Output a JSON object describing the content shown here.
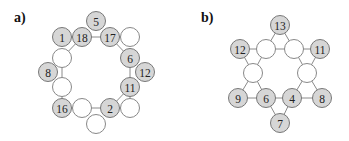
{
  "panels": [
    {
      "label": "a)",
      "label_pos": [
        14,
        10
      ],
      "nodes": [
        {
          "id": "n5",
          "text": "5",
          "x": 96,
          "y": 21,
          "filled": true
        },
        {
          "id": "n1",
          "text": "1",
          "x": 62,
          "y": 37,
          "filled": true
        },
        {
          "id": "n18",
          "text": "18",
          "x": 82,
          "y": 37,
          "filled": true
        },
        {
          "id": "n17",
          "text": "17",
          "x": 110,
          "y": 37,
          "filled": true
        },
        {
          "id": "eTR",
          "text": "",
          "x": 130,
          "y": 37,
          "filled": false
        },
        {
          "id": "eL1",
          "text": "",
          "x": 62,
          "y": 58,
          "filled": false
        },
        {
          "id": "n6",
          "text": "6",
          "x": 130,
          "y": 58,
          "filled": true
        },
        {
          "id": "n8",
          "text": "8",
          "x": 48,
          "y": 72,
          "filled": true
        },
        {
          "id": "n12",
          "text": "12",
          "x": 145,
          "y": 72,
          "filled": true
        },
        {
          "id": "eL2",
          "text": "",
          "x": 62,
          "y": 87,
          "filled": false
        },
        {
          "id": "n11",
          "text": "11",
          "x": 130,
          "y": 87,
          "filled": true
        },
        {
          "id": "n16",
          "text": "16",
          "x": 62,
          "y": 108,
          "filled": true
        },
        {
          "id": "eB1",
          "text": "",
          "x": 82,
          "y": 108,
          "filled": false
        },
        {
          "id": "n2",
          "text": "2",
          "x": 110,
          "y": 108,
          "filled": true
        },
        {
          "id": "eBR",
          "text": "",
          "x": 130,
          "y": 108,
          "filled": false
        },
        {
          "id": "eB",
          "text": "",
          "x": 96,
          "y": 124,
          "filled": false
        }
      ],
      "edges": [
        [
          "n1",
          "n18"
        ],
        [
          "n18",
          "n17"
        ],
        [
          "n17",
          "eTR"
        ],
        [
          "n17",
          "n6"
        ],
        [
          "n18",
          "eL1"
        ],
        [
          "eL1",
          "eL2"
        ],
        [
          "eL2",
          "n16"
        ],
        [
          "n16",
          "eB1"
        ],
        [
          "eB1",
          "n2"
        ],
        [
          "n2",
          "eBR"
        ],
        [
          "n2",
          "n11"
        ],
        [
          "n11",
          "eBR"
        ],
        [
          "n6",
          "n11"
        ]
      ]
    },
    {
      "label": "b)",
      "label_pos": [
        201,
        10
      ],
      "nodes": [
        {
          "id": "n13",
          "text": "13",
          "x": 280,
          "y": 25,
          "filled": true
        },
        {
          "id": "n12",
          "text": "12",
          "x": 240,
          "y": 49,
          "filled": true
        },
        {
          "id": "eTL",
          "text": "",
          "x": 266,
          "y": 49,
          "filled": false
        },
        {
          "id": "eTR",
          "text": "",
          "x": 294,
          "y": 49,
          "filled": false
        },
        {
          "id": "n11",
          "text": "11",
          "x": 320,
          "y": 49,
          "filled": true
        },
        {
          "id": "eL",
          "text": "",
          "x": 253,
          "y": 73,
          "filled": false
        },
        {
          "id": "eR",
          "text": "",
          "x": 307,
          "y": 73,
          "filled": false
        },
        {
          "id": "n9",
          "text": "9",
          "x": 238,
          "y": 98,
          "filled": true
        },
        {
          "id": "n6",
          "text": "6",
          "x": 266,
          "y": 98,
          "filled": true
        },
        {
          "id": "n4",
          "text": "4",
          "x": 292,
          "y": 98,
          "filled": true
        },
        {
          "id": "n8",
          "text": "8",
          "x": 322,
          "y": 98,
          "filled": true
        },
        {
          "id": "n7",
          "text": "7",
          "x": 280,
          "y": 123,
          "filled": true
        }
      ],
      "edges": [
        [
          "n13",
          "eTL"
        ],
        [
          "n13",
          "eTR"
        ],
        [
          "n12",
          "eTL"
        ],
        [
          "eTL",
          "eTR"
        ],
        [
          "eTR",
          "n11"
        ],
        [
          "n12",
          "eL"
        ],
        [
          "eTL",
          "eL"
        ],
        [
          "eTR",
          "eR"
        ],
        [
          "n11",
          "eR"
        ],
        [
          "eL",
          "n9"
        ],
        [
          "eL",
          "n6"
        ],
        [
          "eR",
          "n4"
        ],
        [
          "eR",
          "n8"
        ],
        [
          "n9",
          "n6"
        ],
        [
          "n6",
          "n4"
        ],
        [
          "n4",
          "n8"
        ],
        [
          "n6",
          "n7"
        ],
        [
          "n4",
          "n7"
        ]
      ]
    }
  ],
  "style": {
    "node_radius": 9.5,
    "filled_color": "#d6d6d6",
    "empty_color": "#ffffff",
    "edge_color": "#8a8a8a"
  }
}
